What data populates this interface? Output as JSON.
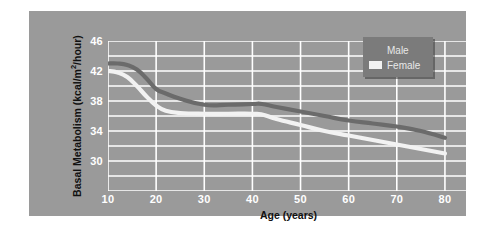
{
  "chart_data": {
    "type": "line",
    "title": "",
    "xlabel": "Age (years)",
    "ylabel": "Basal Metabolism (kcal/m",
    "ylabel_sup": "2",
    "ylabel_tail": "/hour)",
    "xlim": [
      10,
      85
    ],
    "ylim": [
      26,
      46
    ],
    "x_ticks": [
      "10",
      "20",
      "30",
      "40",
      "50",
      "60",
      "70",
      "80"
    ],
    "x_tick_values": [
      10,
      20,
      30,
      40,
      50,
      60,
      70,
      80
    ],
    "y_ticks": [
      "46",
      "42",
      "38",
      "34",
      "30"
    ],
    "y_tick_values": [
      46,
      42,
      38,
      34,
      30
    ],
    "y_gridlines": [
      26,
      28,
      30,
      32,
      34,
      36,
      38,
      40,
      42,
      44,
      46
    ],
    "grid": true,
    "grid_color": "#ffffff",
    "plot_background": "#9a9a9a",
    "legend_position": "top-right",
    "x": [
      10,
      12,
      14,
      16,
      18,
      20,
      22,
      25,
      30,
      35,
      40,
      42,
      45,
      50,
      55,
      60,
      65,
      70,
      75,
      80
    ],
    "series": [
      {
        "name": "Male",
        "color": "#6b6b6b",
        "values": [
          43.0,
          43.0,
          42.8,
          42.2,
          41.0,
          39.6,
          39.0,
          38.3,
          37.5,
          37.5,
          37.6,
          37.6,
          37.2,
          36.6,
          36.0,
          35.4,
          35.0,
          34.6,
          34.0,
          33.1
        ]
      },
      {
        "name": "Female",
        "color": "#f2f2f2",
        "values": [
          42.0,
          41.8,
          41.2,
          40.0,
          38.6,
          37.4,
          36.7,
          36.4,
          36.3,
          36.3,
          36.3,
          36.2,
          35.6,
          34.8,
          34.0,
          33.4,
          32.8,
          32.2,
          31.6,
          31.0
        ]
      }
    ]
  },
  "legend": {
    "items": [
      {
        "label": "Male",
        "swatch_color": "#7b7b7b"
      },
      {
        "label": "Female",
        "swatch_color": "#f2f2f2"
      }
    ]
  },
  "colors": {
    "panel": "#9a9a9a",
    "legend_box": "#7b7b7b",
    "grid": "#ffffff",
    "male_line": "#6b6b6b",
    "female_line": "#f2f2f2",
    "tick_text": "#ffffff",
    "axis_label_text": "#111111"
  }
}
